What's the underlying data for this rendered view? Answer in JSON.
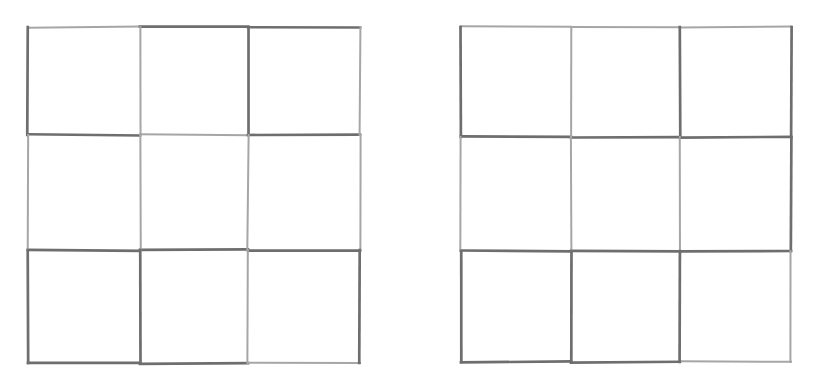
{
  "page": {
    "background_color": "#ffffff",
    "width": 814,
    "height": 383,
    "figure_count": 2,
    "figure_type": "3x3-grid"
  },
  "figures": [
    {
      "id": "left-grid",
      "name": "left-3x3-grid",
      "label": "",
      "rows": 3,
      "cols": 3,
      "cell_count": 9,
      "box": {
        "x": 28,
        "y": 27,
        "width": 332,
        "height": 336
      },
      "v_offsets": [
        0,
        112,
        220,
        332
      ],
      "h_offsets": [
        0,
        108,
        223,
        336
      ],
      "stroke_color": "#6e6e6e",
      "stroke_color_light": "#a6a6a6",
      "stroke_width": 2.4,
      "cells": [
        {
          "row": 0,
          "col": 0,
          "value": ""
        },
        {
          "row": 0,
          "col": 1,
          "value": ""
        },
        {
          "row": 0,
          "col": 2,
          "value": ""
        },
        {
          "row": 1,
          "col": 0,
          "value": ""
        },
        {
          "row": 1,
          "col": 1,
          "value": ""
        },
        {
          "row": 1,
          "col": 2,
          "value": ""
        },
        {
          "row": 2,
          "col": 0,
          "value": ""
        },
        {
          "row": 2,
          "col": 1,
          "value": ""
        },
        {
          "row": 2,
          "col": 2,
          "value": ""
        }
      ]
    },
    {
      "id": "right-grid",
      "name": "right-3x3-grid",
      "label": "",
      "rows": 3,
      "cols": 3,
      "cell_count": 9,
      "box": {
        "x": 461,
        "y": 27,
        "width": 330,
        "height": 335
      },
      "v_offsets": [
        0,
        110,
        219,
        330
      ],
      "h_offsets": [
        0,
        110,
        224,
        335
      ],
      "stroke_color": "#6e6e6e",
      "stroke_color_light": "#a6a6a6",
      "stroke_width": 2.4,
      "cells": [
        {
          "row": 0,
          "col": 0,
          "value": ""
        },
        {
          "row": 0,
          "col": 1,
          "value": ""
        },
        {
          "row": 0,
          "col": 2,
          "value": ""
        },
        {
          "row": 1,
          "col": 0,
          "value": ""
        },
        {
          "row": 1,
          "col": 1,
          "value": ""
        },
        {
          "row": 1,
          "col": 2,
          "value": ""
        },
        {
          "row": 2,
          "col": 0,
          "value": ""
        },
        {
          "row": 2,
          "col": 1,
          "value": ""
        },
        {
          "row": 2,
          "col": 2,
          "value": ""
        }
      ]
    }
  ],
  "chart_data": {
    "type": "table",
    "title": "",
    "xlabel": "",
    "ylabel": "",
    "grids": [
      {
        "name": "left",
        "rows": 3,
        "cols": 3,
        "values": [
          [
            "",
            "",
            ""
          ],
          [
            "",
            "",
            ""
          ],
          [
            "",
            "",
            ""
          ]
        ]
      },
      {
        "name": "right",
        "rows": 3,
        "cols": 3,
        "values": [
          [
            "",
            "",
            ""
          ],
          [
            "",
            "",
            ""
          ],
          [
            "",
            "",
            ""
          ]
        ]
      }
    ]
  }
}
